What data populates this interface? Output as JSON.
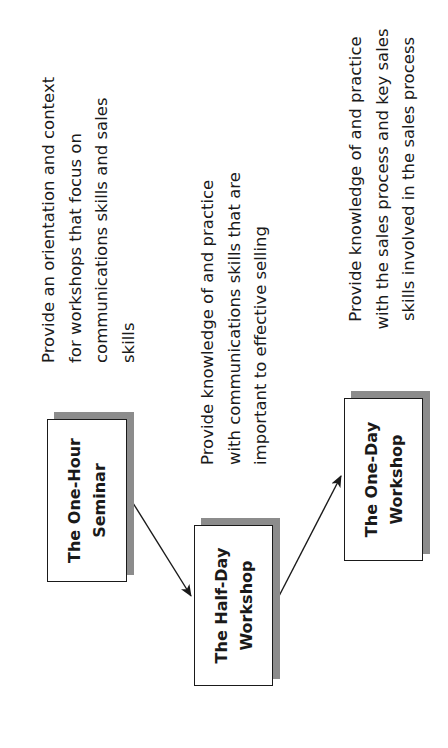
{
  "diagram": {
    "orientation": "rotated 90 degrees counter-clockwise",
    "nodes": [
      {
        "id": "one-hour-seminar",
        "label_lines": [
          "The One-Hour",
          "Seminar"
        ],
        "description_lines": [
          "Provide an orientation and context",
          "for workshops that focus on",
          "communications skills and sales",
          "skills"
        ]
      },
      {
        "id": "half-day-workshop",
        "label_lines": [
          "The Half-Day",
          "Workshop"
        ],
        "description_lines": [
          "Provide knowledge of and practice",
          "with communications skills that are",
          "important to effective selling"
        ]
      },
      {
        "id": "one-day-workshop",
        "label_lines": [
          "The One-Day",
          "Workshop"
        ],
        "description_lines": [
          "Provide knowledge of and practice",
          "with the sales process and key sales",
          "skills involved in the sales process"
        ]
      }
    ],
    "edges": [
      {
        "from": "one-hour-seminar",
        "to": "half-day-workshop"
      },
      {
        "from": "half-day-workshop",
        "to": "one-day-workshop"
      }
    ],
    "colors": {
      "box_fill": "#ffffff",
      "box_border": "#1a1a1a",
      "shadow": "#8c8c8c",
      "text": "#1a1a1a",
      "arrow": "#1a1a1a"
    }
  }
}
